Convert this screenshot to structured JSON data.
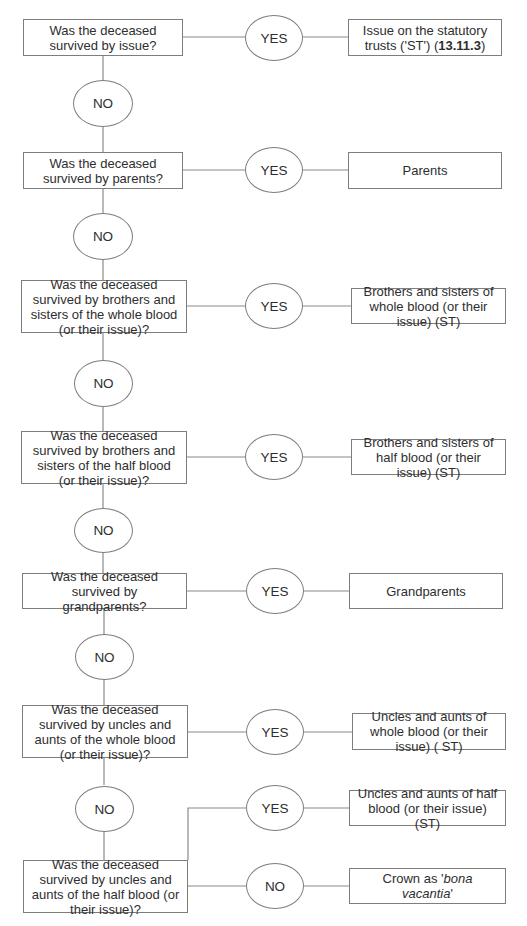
{
  "diagram": {
    "type": "flowchart",
    "topic": "Intestacy distribution order (no surviving spouse)",
    "questions": [
      {
        "id": "q1",
        "text": "Was the deceased survived by issue?"
      },
      {
        "id": "q2",
        "text": "Was the deceased survived by parents?"
      },
      {
        "id": "q3",
        "text": "Was the deceased survived by brothers and sisters of the whole blood (or their issue)?"
      },
      {
        "id": "q4",
        "text": "Was the deceased survived by brothers and sisters of the half blood (or their issue)?"
      },
      {
        "id": "q5",
        "text": "Was the deceased survived by grandparents?"
      },
      {
        "id": "q6",
        "text": "Was the deceased survived by uncles and aunts of the whole blood (or their issue)?"
      },
      {
        "id": "q7",
        "text": "Was the deceased survived by uncles and aunts of the half blood (or their issue)?"
      }
    ],
    "outcomes": [
      {
        "id": "o1",
        "text_pre": "Issue on the statutory trusts ('ST') (",
        "text_bold": "13.11.3",
        "text_post": ")"
      },
      {
        "id": "o2",
        "text": "Parents"
      },
      {
        "id": "o3",
        "text": "Brothers and sisters of whole blood (or their issue) (ST)"
      },
      {
        "id": "o4",
        "text": "Brothers and sisters of half blood (or their issue) (ST)"
      },
      {
        "id": "o5",
        "text": "Grandparents"
      },
      {
        "id": "o6",
        "text": "Uncles and aunts of whole blood (or their issue) ( ST)"
      },
      {
        "id": "o7",
        "text": "Uncles and aunts of half blood (or their issue) (ST)"
      },
      {
        "id": "o8",
        "text_pre": "Crown as '",
        "text_italic": "bona vacantia",
        "text_post": "'"
      }
    ],
    "labels": {
      "yes": "YES",
      "no": "NO"
    },
    "edges": [
      {
        "from": "q1",
        "label": "YES",
        "to": "o1"
      },
      {
        "from": "q1",
        "label": "NO",
        "to": "q2"
      },
      {
        "from": "q2",
        "label": "YES",
        "to": "o2"
      },
      {
        "from": "q2",
        "label": "NO",
        "to": "q3"
      },
      {
        "from": "q3",
        "label": "YES",
        "to": "o3"
      },
      {
        "from": "q3",
        "label": "NO",
        "to": "q4"
      },
      {
        "from": "q4",
        "label": "YES",
        "to": "o4"
      },
      {
        "from": "q4",
        "label": "NO",
        "to": "q5"
      },
      {
        "from": "q5",
        "label": "YES",
        "to": "o5"
      },
      {
        "from": "q5",
        "label": "NO",
        "to": "q6"
      },
      {
        "from": "q6",
        "label": "YES",
        "to": "o6"
      },
      {
        "from": "q6",
        "label": "NO",
        "to": "q7"
      },
      {
        "from": "q7",
        "label": "YES",
        "to": "o7"
      },
      {
        "from": "q7",
        "label": "NO",
        "to": "o8"
      }
    ],
    "colors": {
      "stroke": "#7d7d7d",
      "text": "#2e2e2e",
      "background": "#ffffff"
    }
  }
}
